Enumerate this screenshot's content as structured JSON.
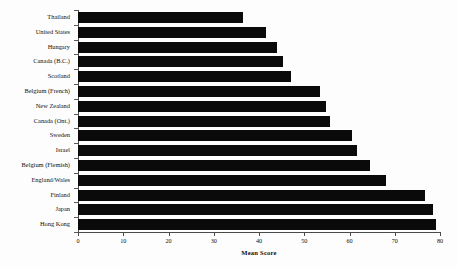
{
  "chart_data": {
    "type": "bar",
    "orientation": "horizontal",
    "title": "",
    "xlabel": "Mean Score",
    "ylabel": "",
    "xlim": [
      0,
      80
    ],
    "xticks": [
      0,
      10,
      20,
      30,
      40,
      50,
      60,
      70,
      80
    ],
    "grid": false,
    "legend": null,
    "bar_color": "#0a0a0a",
    "categories": [
      "Thailand",
      "United States",
      "Hungary",
      "Canada (B.C.)",
      "Scotland",
      "Belgium (French)",
      "New Zealand",
      "Canada (Ont.)",
      "Sweden",
      "Israel",
      "Belgium (Flemish)",
      "England/Wales",
      "Finland",
      "Japan",
      "Hong Kong"
    ],
    "values": [
      36.4,
      41.5,
      43.9,
      45.3,
      47.0,
      53.4,
      54.7,
      55.8,
      60.5,
      61.6,
      64.6,
      68.1,
      76.6,
      78.4,
      79.2
    ]
  }
}
